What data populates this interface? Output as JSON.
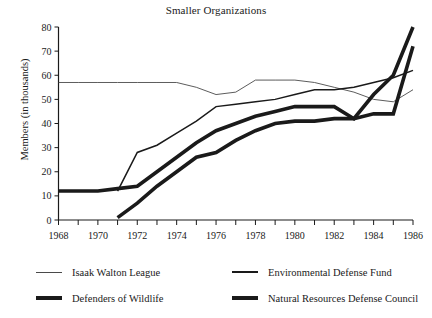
{
  "chart_data": {
    "type": "line",
    "title": "Smaller Organizations",
    "xlabel": "",
    "ylabel": "Members (in thousands)",
    "xlim": [
      1968,
      1986
    ],
    "ylim": [
      0,
      80
    ],
    "yticks": [
      0,
      10,
      20,
      30,
      40,
      50,
      60,
      70,
      80
    ],
    "xticks": [
      1968,
      1970,
      1972,
      1974,
      1976,
      1978,
      1980,
      1982,
      1984,
      1986
    ],
    "xtick_minor_step": 1,
    "grid": false,
    "legend_position": "below",
    "x": [
      1968,
      1969,
      1970,
      1971,
      1972,
      1973,
      1974,
      1975,
      1976,
      1977,
      1978,
      1979,
      1980,
      1981,
      1982,
      1983,
      1984,
      1985,
      1986
    ],
    "series": [
      {
        "name": "Isaak Walton League",
        "line_weight": "thin",
        "color": "#4a4a4a",
        "values": [
          57,
          57,
          57,
          57,
          57,
          57,
          57,
          55,
          52,
          53,
          58,
          58,
          58,
          57,
          55,
          53,
          50,
          49,
          54
        ]
      },
      {
        "name": "Environmental Defense Fund",
        "line_weight": "medium",
        "color": "#1a1a1a",
        "values": [
          null,
          null,
          null,
          12,
          28,
          31,
          36,
          41,
          47,
          48,
          49,
          50,
          52,
          54,
          54,
          55,
          57,
          59,
          62
        ]
      },
      {
        "name": "Defenders of Wildlife",
        "line_weight": "thick",
        "color": "#1a1a1a",
        "values": [
          12,
          12,
          12,
          13,
          14,
          20,
          26,
          32,
          37,
          40,
          43,
          45,
          47,
          47,
          47,
          42,
          52,
          60,
          80
        ]
      },
      {
        "name": "Natural Resources Defense Council",
        "line_weight": "thick",
        "color": "#1a1a1a",
        "values": [
          null,
          null,
          null,
          1,
          7,
          14,
          20,
          26,
          28,
          33,
          37,
          40,
          41,
          41,
          42,
          42,
          44,
          44,
          72
        ]
      }
    ]
  },
  "title": {
    "text": "Smaller Organizations"
  },
  "axes": {
    "y_axis_label": "Members (in thousands)",
    "y_tick_labels": [
      "0",
      "10",
      "20",
      "30",
      "40",
      "50",
      "60",
      "70",
      "80"
    ],
    "x_tick_labels": [
      "1968",
      "1970",
      "1972",
      "1974",
      "1976",
      "1978",
      "1980",
      "1982",
      "1984",
      "1986"
    ]
  },
  "legend": {
    "rows": [
      [
        {
          "label": "Isaak Walton League",
          "weight": "w1"
        },
        {
          "label": "Environmental Defense Fund",
          "weight": "w2"
        }
      ],
      [
        {
          "label": "Defenders of Wildlife",
          "weight": "w3"
        },
        {
          "label": "Natural Resources Defense Council",
          "weight": "w4"
        }
      ]
    ]
  }
}
